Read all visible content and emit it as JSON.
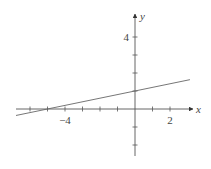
{
  "chart_data": {
    "type": "line",
    "title": "",
    "xlabel": "x",
    "ylabel": "y",
    "xlim": [
      -6.8,
      3.14
    ],
    "ylim": [
      -2.5,
      5.5
    ],
    "x_ticks": [
      -6,
      -5,
      -4,
      -3,
      -2,
      -1,
      1,
      2
    ],
    "y_ticks": [
      -2,
      -1,
      1,
      2,
      3,
      4
    ],
    "x_tick_labels": [
      {
        "value": -4,
        "label": "−4"
      },
      {
        "value": 2,
        "label": "2"
      }
    ],
    "y_tick_labels": [
      {
        "value": 4,
        "label": "4"
      }
    ],
    "grid": false,
    "series": [
      {
        "name": "y = 0.2x + 1",
        "slope": 0.2,
        "intercept": 1,
        "x": [
          -6.8,
          3.14
        ],
        "y": [
          -0.36,
          1.63
        ]
      }
    ]
  }
}
